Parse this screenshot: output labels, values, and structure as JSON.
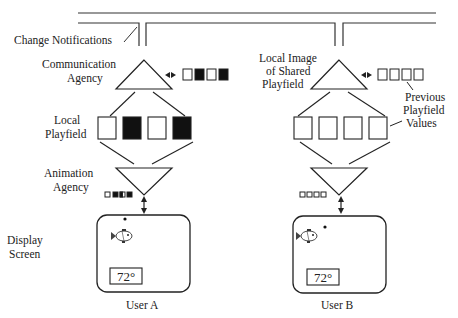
{
  "labels": {
    "change_notifications": "Change Notifications",
    "communication_agency": [
      "Communication",
      "Agency"
    ],
    "local_image": [
      "Local Image",
      "of Shared",
      "Playfield"
    ],
    "local_playfield": [
      "Local",
      "Playfield"
    ],
    "previous_values": [
      "Previous",
      "Playfield",
      "Values"
    ],
    "animation_agency": [
      "Animation",
      "Agency"
    ],
    "display_screen": [
      "Display",
      "Screen"
    ]
  },
  "users": [
    {
      "name": "User A",
      "temperature": "72°",
      "shared_image_cells": [
        "white",
        "black",
        "white",
        "black"
      ],
      "local_playfield_cells": [
        "white",
        "black",
        "white",
        "black"
      ],
      "animation_cells": [
        "white",
        "black",
        "half",
        "black"
      ]
    },
    {
      "name": "User B",
      "temperature": "72°",
      "shared_image_cells": [
        "white",
        "white",
        "white",
        "white"
      ],
      "local_playfield_cells": [
        "white",
        "white",
        "white",
        "white"
      ],
      "animation_cells": [
        "white",
        "white",
        "white",
        "white"
      ]
    }
  ],
  "colors": {
    "stroke": "#222222",
    "fill_dark": "#111111",
    "background": "#ffffff"
  }
}
